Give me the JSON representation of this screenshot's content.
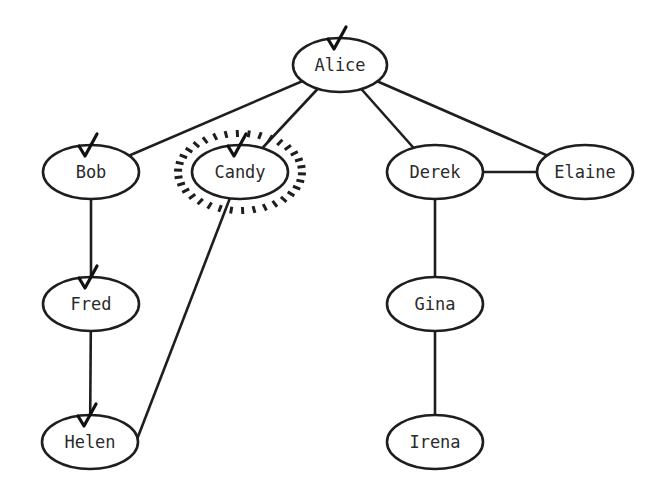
{
  "diagram": {
    "type": "graph",
    "nodes": [
      {
        "id": "alice",
        "label": "Alice",
        "x": 340,
        "y": 65,
        "rx": 47,
        "ry": 27,
        "checked": true,
        "highlighted": false
      },
      {
        "id": "bob",
        "label": "Bob",
        "x": 91,
        "y": 172,
        "rx": 48,
        "ry": 27,
        "checked": true,
        "highlighted": false
      },
      {
        "id": "candy",
        "label": "Candy",
        "x": 240,
        "y": 172,
        "rx": 48,
        "ry": 27,
        "checked": true,
        "highlighted": true
      },
      {
        "id": "derek",
        "label": "Derek",
        "x": 435,
        "y": 172,
        "rx": 48,
        "ry": 27,
        "checked": false,
        "highlighted": false
      },
      {
        "id": "elaine",
        "label": "Elaine",
        "x": 585,
        "y": 172,
        "rx": 48,
        "ry": 27,
        "checked": false,
        "highlighted": false
      },
      {
        "id": "fred",
        "label": "Fred",
        "x": 91,
        "y": 304,
        "rx": 48,
        "ry": 27,
        "checked": true,
        "highlighted": false
      },
      {
        "id": "gina",
        "label": "Gina",
        "x": 435,
        "y": 304,
        "rx": 48,
        "ry": 27,
        "checked": false,
        "highlighted": false
      },
      {
        "id": "helen",
        "label": "Helen",
        "x": 90,
        "y": 442,
        "rx": 48,
        "ry": 27,
        "checked": true,
        "highlighted": false
      },
      {
        "id": "irena",
        "label": "Irena",
        "x": 435,
        "y": 442,
        "rx": 48,
        "ry": 27,
        "checked": false,
        "highlighted": false
      }
    ],
    "edges": [
      {
        "from": "alice",
        "to": "bob"
      },
      {
        "from": "alice",
        "to": "candy"
      },
      {
        "from": "alice",
        "to": "derek"
      },
      {
        "from": "alice",
        "to": "elaine"
      },
      {
        "from": "derek",
        "to": "elaine"
      },
      {
        "from": "bob",
        "to": "fred"
      },
      {
        "from": "fred",
        "to": "helen"
      },
      {
        "from": "candy",
        "to": "helen"
      },
      {
        "from": "derek",
        "to": "gina"
      },
      {
        "from": "gina",
        "to": "irena"
      }
    ],
    "colors": {
      "stroke": "#1e1e1e",
      "fill": "#ffffff",
      "text": "#2a2a2a",
      "background": "#ffffff"
    }
  }
}
